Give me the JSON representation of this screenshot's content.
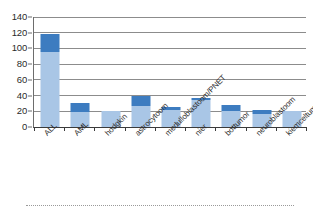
{
  "chart_data": {
    "type": "bar",
    "title": "",
    "subtitle": "",
    "xlabel": "",
    "ylabel": "",
    "grid": true,
    "stacked": true,
    "legend_position": "none",
    "ylim": [
      0,
      140
    ],
    "yticks": [
      0,
      20,
      40,
      60,
      80,
      100,
      120,
      140
    ],
    "ytick_labels": [
      "0",
      "20",
      "40",
      "60",
      "80",
      "100",
      "120",
      "140"
    ],
    "categories": [
      "ALL",
      "AML",
      "hodgkin",
      "astrocytoom",
      "medulloblastoom/PNET",
      "nier",
      "bottumor",
      "neuroblastoom",
      "kiemceltumor"
    ],
    "series": [
      {
        "name": "light-blue-segment",
        "color": "#a9c6e6",
        "values": [
          95,
          19,
          20,
          27,
          22,
          34,
          21,
          16,
          21
        ]
      },
      {
        "name": "dark-blue-segment",
        "color": "#3d7cc0",
        "values": [
          23,
          11,
          0,
          13,
          4,
          3,
          7,
          6,
          0
        ]
      }
    ],
    "totals": [
      118,
      30,
      20,
      40,
      26,
      37,
      28,
      22,
      21
    ],
    "colors": {
      "light_blue": "#a9c6e6",
      "dark_blue": "#3d7cc0",
      "gridline": "#8c8c8c",
      "axis": "#3b3b3b",
      "text": "#2d2d2d"
    }
  }
}
